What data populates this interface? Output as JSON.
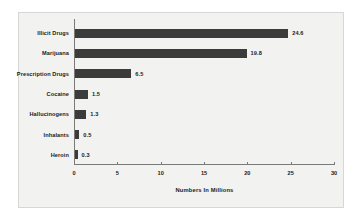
{
  "chart_data": {
    "type": "bar",
    "orientation": "horizontal",
    "title": "",
    "xlabel": "Numbers In Millions",
    "ylabel": "",
    "categories": [
      "Illicit Drugs",
      "Marijuana",
      "Prescription Drugs",
      "Cocaine",
      "Hallucinogens",
      "Inhalants",
      "Heroin"
    ],
    "values": [
      24.6,
      19.8,
      6.5,
      1.5,
      1.3,
      0.5,
      0.3
    ],
    "value_labels": [
      "24.6",
      "19.8",
      "6.5",
      "1.5",
      "1.3",
      "0.5",
      "0.3"
    ],
    "xlim": [
      0,
      30
    ],
    "xticks": [
      0,
      5,
      10,
      15,
      20,
      25,
      30
    ],
    "xtick_labels": [
      "0",
      "5",
      "10",
      "15",
      "20",
      "25",
      "30"
    ],
    "grid": false,
    "legend": false,
    "bar_color": "#3b3b3b",
    "plot_background": "#f2f2f1",
    "axis_color": "#7a7a78",
    "text_color": "#1a1a1a"
  }
}
